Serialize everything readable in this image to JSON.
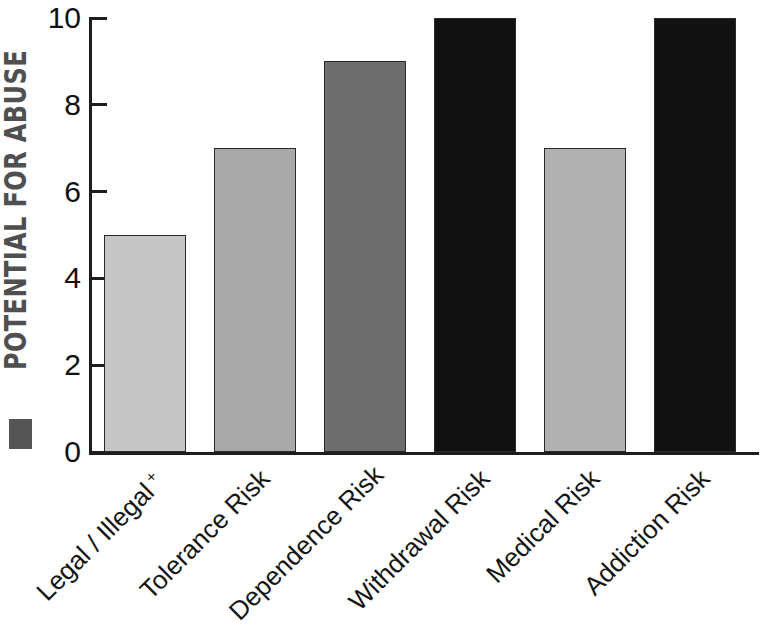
{
  "chart_data": {
    "type": "bar",
    "title": "",
    "ylabel": "POTENTIAL FOR ABUSE",
    "xlabel": "",
    "ylim": [
      0,
      10
    ],
    "yticks": [
      0,
      2,
      4,
      6,
      8,
      10
    ],
    "ytick_labels": [
      "0",
      "2",
      "4",
      "6",
      "8",
      "10"
    ],
    "grid": false,
    "legend": false,
    "categories": [
      "Legal / Illegal +",
      "Tolerance Risk",
      "Dependence Risk",
      "Withdrawal Risk",
      "Medical Risk",
      "Addiction Risk"
    ],
    "values": [
      5,
      7,
      9,
      10,
      7,
      10
    ],
    "bar_colors": [
      "#c6c6c6",
      "#a9a9a9",
      "#6e6e6e",
      "#111111",
      "#b0b0b0",
      "#121212"
    ],
    "bar_edge_color": "#2a2a2a",
    "axis_color": "#1d1d1d",
    "background": "#ffffff"
  },
  "axis": {
    "y_title": "POTENTIAL FOR ABUSE",
    "y_title_color": "#4f4f4f",
    "marker_color": "#555555"
  },
  "xlabels": [
    {
      "text": "Legal / Illegal",
      "sup": "+"
    },
    {
      "text": "Tolerance Risk",
      "sup": ""
    },
    {
      "text": "Dependence Risk",
      "sup": ""
    },
    {
      "text": "Withdrawal Risk",
      "sup": ""
    },
    {
      "text": "Medical Risk",
      "sup": ""
    },
    {
      "text": "Addiction Risk",
      "sup": ""
    }
  ]
}
